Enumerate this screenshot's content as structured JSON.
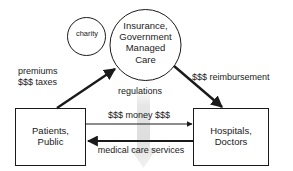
{
  "diagram": {
    "background_color": "#ffffff",
    "stroke_color": "#1a1a1a",
    "watermark_color": "#e2e2e2",
    "nodes": {
      "charity": {
        "label": "charity",
        "shape": "circle"
      },
      "insurer": {
        "label": "Insurance,\nGovernment\nManaged\nCare",
        "shape": "circle"
      },
      "patients": {
        "label": "Patients,\nPublic",
        "shape": "rectangle"
      },
      "hospitals": {
        "label": "Hospitals,\nDoctors",
        "shape": "rectangle"
      }
    },
    "edges": {
      "premiums": {
        "label": "premiums\n$$$ taxes",
        "from": "patients",
        "to": "insurer",
        "weight": "thick"
      },
      "reimbursement": {
        "label": "$$$ reimbursement",
        "from": "insurer",
        "to": "hospitals",
        "weight": "thick"
      },
      "regulations": {
        "label": "regulations",
        "from": "insurer",
        "to": "",
        "weight": "none"
      },
      "money": {
        "label": "$$$ money $$$",
        "from": "patients",
        "to": "hospitals",
        "weight": "thin"
      },
      "services": {
        "label": "medical care services",
        "from": "hospitals",
        "to": "patients",
        "weight": "thick"
      }
    }
  }
}
